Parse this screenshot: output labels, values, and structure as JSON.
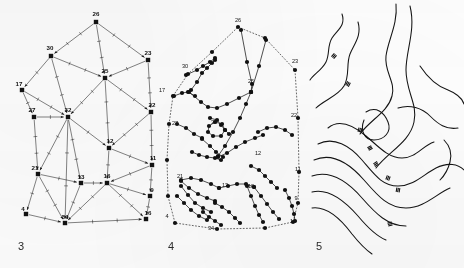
{
  "figure": {
    "background_color": "#fefefe",
    "ink_color": "#1a1a1a",
    "panel_count": 3
  },
  "captions": {
    "panel3": "3",
    "panel4": "4",
    "panel5": "5"
  },
  "panel3": {
    "name": "triangulated-network-graph",
    "marker_shape": "filled-square",
    "edge_style": "solid-with-arrowheads-and-tick-marks",
    "nodes": [
      {
        "id": "26",
        "label": "26",
        "x": 96,
        "y": 22,
        "lx": 96,
        "ly": 16
      },
      {
        "id": "23",
        "label": "23",
        "x": 148,
        "y": 60,
        "lx": 148,
        "ly": 55
      },
      {
        "id": "30",
        "label": "30",
        "x": 51,
        "y": 56,
        "lx": 50,
        "ly": 50
      },
      {
        "id": "25",
        "label": "25",
        "x": 105,
        "y": 78,
        "lx": 105,
        "ly": 73
      },
      {
        "id": "17",
        "label": "17",
        "x": 22,
        "y": 90,
        "lx": 19,
        "ly": 86
      },
      {
        "id": "22",
        "label": "22",
        "x": 151,
        "y": 112,
        "lx": 152,
        "ly": 107
      },
      {
        "id": "27",
        "label": "27",
        "x": 34,
        "y": 117,
        "lx": 32,
        "ly": 112
      },
      {
        "id": "32",
        "label": "32",
        "x": 68,
        "y": 117,
        "lx": 68,
        "ly": 112
      },
      {
        "id": "12",
        "label": "12",
        "x": 109,
        "y": 148,
        "lx": 110,
        "ly": 143
      },
      {
        "id": "11",
        "label": "11",
        "x": 152,
        "y": 165,
        "lx": 153,
        "ly": 160
      },
      {
        "id": "21",
        "label": "21",
        "x": 38,
        "y": 174,
        "lx": 35,
        "ly": 170
      },
      {
        "id": "13",
        "label": "13",
        "x": 81,
        "y": 183,
        "lx": 81,
        "ly": 179
      },
      {
        "id": "16",
        "label": "16",
        "x": 107,
        "y": 183,
        "lx": 107,
        "ly": 178
      },
      {
        "id": "9",
        "label": "9",
        "x": 150,
        "y": 196,
        "lx": 152,
        "ly": 192
      },
      {
        "id": "4",
        "label": "4",
        "x": 26,
        "y": 214,
        "lx": 23,
        "ly": 211
      },
      {
        "id": "34",
        "label": "34",
        "x": 65,
        "y": 223,
        "lx": 65,
        "ly": 219
      },
      {
        "id": "15",
        "label": "16",
        "x": 146,
        "y": 219,
        "lx": 148,
        "ly": 215
      }
    ],
    "edges": [
      {
        "from": "26",
        "to": "30",
        "arrow": "to"
      },
      {
        "from": "26",
        "to": "23",
        "arrow": "to"
      },
      {
        "from": "26",
        "to": "25",
        "arrow": "to"
      },
      {
        "from": "30",
        "to": "25",
        "arrow": "to"
      },
      {
        "from": "30",
        "to": "17",
        "arrow": "to"
      },
      {
        "from": "30",
        "to": "32",
        "arrow": "to"
      },
      {
        "from": "23",
        "to": "25",
        "arrow": "to"
      },
      {
        "from": "23",
        "to": "22",
        "arrow": "to"
      },
      {
        "from": "25",
        "to": "32",
        "arrow": "to"
      },
      {
        "from": "25",
        "to": "12",
        "arrow": "to"
      },
      {
        "from": "25",
        "to": "22",
        "arrow": "to"
      },
      {
        "from": "17",
        "to": "27",
        "arrow": "to"
      },
      {
        "from": "17",
        "to": "32",
        "arrow": "to"
      },
      {
        "from": "27",
        "to": "32",
        "arrow": "to"
      },
      {
        "from": "27",
        "to": "21",
        "arrow": "to"
      },
      {
        "from": "32",
        "to": "12",
        "arrow": "to"
      },
      {
        "from": "32",
        "to": "13",
        "arrow": "to"
      },
      {
        "from": "32",
        "to": "21",
        "arrow": "to"
      },
      {
        "from": "32",
        "to": "34",
        "arrow": "to"
      },
      {
        "from": "22",
        "to": "12",
        "arrow": "to"
      },
      {
        "from": "22",
        "to": "11",
        "arrow": "to"
      },
      {
        "from": "12",
        "to": "16",
        "arrow": "to"
      },
      {
        "from": "12",
        "to": "11",
        "arrow": "to"
      },
      {
        "from": "11",
        "to": "16",
        "arrow": "to"
      },
      {
        "from": "11",
        "to": "9",
        "arrow": "to"
      },
      {
        "from": "21",
        "to": "13",
        "arrow": "to"
      },
      {
        "from": "21",
        "to": "4",
        "arrow": "to"
      },
      {
        "from": "21",
        "to": "34",
        "arrow": "to"
      },
      {
        "from": "13",
        "to": "16",
        "arrow": "to"
      },
      {
        "from": "13",
        "to": "34",
        "arrow": "to"
      },
      {
        "from": "16",
        "to": "9",
        "arrow": "to"
      },
      {
        "from": "16",
        "to": "34",
        "arrow": "to"
      },
      {
        "from": "16",
        "to": "15",
        "arrow": "to"
      },
      {
        "from": "9",
        "to": "15",
        "arrow": "to"
      },
      {
        "from": "4",
        "to": "34",
        "arrow": "to"
      },
      {
        "from": "34",
        "to": "15",
        "arrow": "to"
      }
    ]
  },
  "panel4": {
    "name": "point-polyline-map",
    "marker_shape": "filled-circle",
    "boundary_style": "dotted",
    "labels": [
      {
        "text": "26",
        "x": 83,
        "y": 22
      },
      {
        "text": "23",
        "x": 140,
        "y": 63
      },
      {
        "text": "30",
        "x": 30,
        "y": 68
      },
      {
        "text": "25",
        "x": 96,
        "y": 83
      },
      {
        "text": "17",
        "x": 7,
        "y": 92
      },
      {
        "text": "22",
        "x": 139,
        "y": 117
      },
      {
        "text": "27",
        "x": 20,
        "y": 125
      },
      {
        "text": "32",
        "x": 59,
        "y": 124
      },
      {
        "text": "12",
        "x": 103,
        "y": 155
      },
      {
        "text": "11",
        "x": 143,
        "y": 171
      },
      {
        "text": "21",
        "x": 25,
        "y": 178
      },
      {
        "text": "13",
        "x": 70,
        "y": 187
      },
      {
        "text": "18",
        "x": 96,
        "y": 188
      },
      {
        "text": "9",
        "x": 141,
        "y": 200
      },
      {
        "text": "4",
        "x": 12,
        "y": 218
      },
      {
        "text": "34",
        "x": 56,
        "y": 230
      },
      {
        "text": "16",
        "x": 138,
        "y": 223
      }
    ],
    "boundary_points": [
      [
        83,
        27
      ],
      [
        110,
        38
      ],
      [
        140,
        70
      ],
      [
        143,
        118
      ],
      [
        144,
        172
      ],
      [
        143,
        203
      ],
      [
        138,
        222
      ],
      [
        110,
        228
      ],
      [
        62,
        229
      ],
      [
        20,
        223
      ],
      [
        13,
        196
      ],
      [
        12,
        160
      ],
      [
        14,
        124
      ],
      [
        18,
        96
      ],
      [
        33,
        74
      ],
      [
        57,
        52
      ]
    ],
    "polylines": [
      {
        "points": [
          [
            31,
            75
          ],
          [
            42,
            70
          ],
          [
            48,
            66
          ],
          [
            55,
            62
          ],
          [
            60,
            58
          ]
        ]
      },
      {
        "points": [
          [
            19,
            96
          ],
          [
            27,
            93
          ],
          [
            33,
            92
          ],
          [
            40,
            96
          ]
        ]
      },
      {
        "points": [
          [
            34,
            92
          ],
          [
            46,
            102
          ],
          [
            53,
            107
          ],
          [
            62,
            108
          ],
          [
            72,
            104
          ],
          [
            84,
            98
          ],
          [
            96,
            92
          ]
        ]
      },
      {
        "points": [
          [
            60,
            60
          ],
          [
            57,
            63
          ],
          [
            52,
            68
          ],
          [
            47,
            73
          ],
          [
            42,
            82
          ],
          [
            36,
            90
          ]
        ]
      },
      {
        "points": [
          [
            96,
            92
          ],
          [
            97,
            84
          ],
          [
            92,
            62
          ],
          [
            86,
            30
          ]
        ]
      },
      {
        "points": [
          [
            96,
            92
          ],
          [
            104,
            66
          ],
          [
            111,
            40
          ]
        ]
      },
      {
        "points": [
          [
            22,
            124
          ],
          [
            31,
            128
          ],
          [
            39,
            134
          ],
          [
            47,
            138
          ]
        ]
      },
      {
        "points": [
          [
            55,
            118
          ],
          [
            62,
            120
          ],
          [
            66,
            125
          ],
          [
            70,
            130
          ],
          [
            74,
            134
          ]
        ]
      },
      {
        "points": [
          [
            96,
            92
          ],
          [
            91,
            104
          ],
          [
            85,
            118
          ],
          [
            78,
            132
          ],
          [
            70,
            146
          ],
          [
            63,
            156
          ]
        ]
      },
      {
        "points": [
          [
            47,
            139
          ],
          [
            55,
            146
          ],
          [
            61,
            152
          ],
          [
            68,
            157
          ]
        ]
      },
      {
        "points": [
          [
            37,
            152
          ],
          [
            44,
            155
          ],
          [
            52,
            157
          ],
          [
            60,
            158
          ],
          [
            66,
            160
          ]
        ]
      },
      {
        "points": [
          [
            63,
            157
          ],
          [
            72,
            153
          ],
          [
            81,
            147
          ],
          [
            90,
            142
          ],
          [
            100,
            138
          ],
          [
            108,
            135
          ]
        ]
      },
      {
        "points": [
          [
            103,
            132
          ],
          [
            112,
            128
          ],
          [
            121,
            127
          ],
          [
            130,
            130
          ],
          [
            137,
            135
          ]
        ]
      },
      {
        "points": [
          [
            26,
            180
          ],
          [
            36,
            178
          ],
          [
            46,
            180
          ],
          [
            56,
            184
          ],
          [
            64,
            188
          ]
        ]
      },
      {
        "points": [
          [
            26,
            181
          ],
          [
            34,
            188
          ],
          [
            43,
            194
          ],
          [
            52,
            198
          ],
          [
            60,
            201
          ]
        ]
      },
      {
        "points": [
          [
            26,
            186
          ],
          [
            33,
            195
          ],
          [
            40,
            203
          ],
          [
            48,
            208
          ],
          [
            56,
            212
          ]
        ]
      },
      {
        "points": [
          [
            22,
            196
          ],
          [
            29,
            203
          ],
          [
            36,
            210
          ],
          [
            44,
            216
          ],
          [
            52,
            220
          ]
        ]
      },
      {
        "points": [
          [
            64,
            188
          ],
          [
            73,
            186
          ],
          [
            82,
            184
          ],
          [
            91,
            184
          ],
          [
            99,
            187
          ]
        ]
      },
      {
        "points": [
          [
            96,
            166
          ],
          [
            104,
            170
          ],
          [
            110,
            176
          ],
          [
            116,
            182
          ],
          [
            122,
            188
          ]
        ]
      },
      {
        "points": [
          [
            99,
            187
          ],
          [
            106,
            196
          ],
          [
            112,
            204
          ],
          [
            118,
            212
          ],
          [
            124,
            219
          ]
        ]
      },
      {
        "points": [
          [
            92,
            186
          ],
          [
            96,
            196
          ],
          [
            100,
            206
          ],
          [
            104,
            215
          ],
          [
            108,
            222
          ]
        ]
      },
      {
        "points": [
          [
            130,
            190
          ],
          [
            134,
            198
          ],
          [
            137,
            206
          ],
          [
            139,
            214
          ],
          [
            140,
            221
          ]
        ]
      },
      {
        "points": [
          [
            60,
            203
          ],
          [
            67,
            207
          ],
          [
            74,
            212
          ],
          [
            80,
            218
          ],
          [
            85,
            223
          ]
        ]
      },
      {
        "points": [
          [
            48,
            212
          ],
          [
            54,
            217
          ],
          [
            60,
            221
          ],
          [
            66,
            225
          ]
        ]
      }
    ],
    "cluster_ring": [
      [
        54,
        126
      ],
      [
        60,
        122
      ],
      [
        67,
        124
      ],
      [
        70,
        130
      ],
      [
        66,
        136
      ],
      [
        58,
        136
      ],
      [
        53,
        132
      ]
    ]
  },
  "panel5": {
    "name": "contour-line-map",
    "line_style": "solid-smooth",
    "tick_mark_count": 7,
    "contours": [
      "M 32 14 C 36 26, 27 30, 22 38 C 17 46, 20 54, 16 62 C 12 70, 4 74, 0 80",
      "M 48 22 C 52 36, 44 44, 40 54 C 36 64, 40 76, 34 86 C 28 96, 14 100, 6 108",
      "M 86 4 C 88 24, 78 40, 76 56 C 74 72, 86 82, 82 96 C 78 112, 60 120, 50 134",
      "M 100 6 C 106 30, 96 50, 96 70 C 96 92, 108 104, 104 122 C 100 142, 78 152, 66 168",
      "M 56 112 C 66 106, 74 112, 78 122 C 82 132, 74 140, 64 140 C 54 140, 50 130, 54 120",
      "M 18 128 C 30 118, 44 126, 56 136 C 68 146, 78 158, 92 158 C 106 158, 112 146, 124 142",
      "M 8 144 C 24 136, 40 146, 52 160 C 64 174, 72 186, 88 186 C 104 186, 114 174, 126 168 C 138 162, 148 164, 154 170",
      "M 4 160 C 22 152, 40 164, 54 180 C 68 196, 78 208, 96 208 C 114 208, 126 194, 140 188",
      "M 2 176 C 20 170, 38 182, 52 198 C 66 214, 78 226, 96 226",
      "M 2 192 C 18 188, 34 200, 48 216 C 58 228, 66 236, 76 240",
      "M 2 208 C 16 206, 30 218, 42 234 C 50 244, 56 250, 62 254",
      "M 134 140 C 140 146, 142 154, 140 162 C 138 170, 134 176, 130 180",
      "M 88 108 C 100 104, 112 108, 120 116 C 128 124, 136 130, 148 128",
      "M 110 66 C 118 78, 126 86, 138 90 C 148 94, 152 98, 154 104"
    ],
    "ticks": [
      {
        "x": 24,
        "y": 56,
        "angle": 42
      },
      {
        "x": 38,
        "y": 84,
        "angle": 28
      },
      {
        "x": 50,
        "y": 130,
        "angle": 12
      },
      {
        "x": 60,
        "y": 148,
        "angle": 62
      },
      {
        "x": 66,
        "y": 164,
        "angle": 58
      },
      {
        "x": 78,
        "y": 178,
        "angle": 20
      },
      {
        "x": 88,
        "y": 190,
        "angle": 10
      },
      {
        "x": 80,
        "y": 224,
        "angle": 75
      }
    ]
  }
}
